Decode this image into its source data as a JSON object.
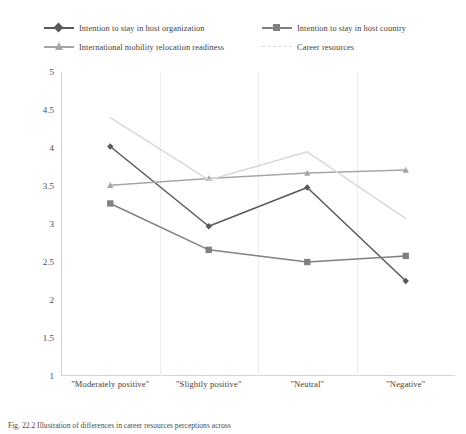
{
  "figure": {
    "caption": "Fig. 22.2  Illustration of differences in career resources perceptions across"
  },
  "legend": {
    "position": "top",
    "items": [
      {
        "label": "Intention to stay in host organization",
        "color": "#595959",
        "marker": "diamond",
        "style": "solid"
      },
      {
        "label": "Intention to stay in host country",
        "color": "#808080",
        "marker": "square",
        "style": "solid"
      },
      {
        "label": "International mobility relocation readiness",
        "color": "#a6a6a6",
        "marker": "triangle",
        "style": "solid"
      },
      {
        "label": "Career resources",
        "color": "#d9d9d9",
        "marker": "none",
        "style": "dashed"
      }
    ]
  },
  "axes": {
    "y_ticks": [
      "5",
      "4.5",
      "4",
      "3.5",
      "3",
      "2.5",
      "2",
      "1.5",
      "1"
    ],
    "x_categories": [
      "\"Moderately positive\"",
      "\"Slightly positive\"",
      "\"Neutral\"",
      "\"Negative\""
    ]
  },
  "chart_data": {
    "type": "line",
    "title": "",
    "xlabel": "",
    "ylabel": "",
    "ylim": [
      1,
      5
    ],
    "ytick_step": 0.5,
    "grid": "vertical",
    "legend_position": "top",
    "categories": [
      "\"Moderately positive\"",
      "\"Slightly positive\"",
      "\"Neutral\"",
      "\"Negative\""
    ],
    "series": [
      {
        "name": "Intention to stay in host organization",
        "color": "#595959",
        "marker": "diamond",
        "linestyle": "solid",
        "values": [
          4.02,
          2.97,
          3.48,
          2.25
        ]
      },
      {
        "name": "Intention to stay in host country",
        "color": "#808080",
        "marker": "square",
        "linestyle": "solid",
        "values": [
          3.27,
          2.66,
          2.5,
          2.58
        ]
      },
      {
        "name": "International mobility relocation readiness",
        "color": "#a6a6a6",
        "marker": "triangle",
        "linestyle": "solid",
        "values": [
          3.51,
          3.6,
          3.67,
          3.71
        ]
      },
      {
        "name": "Career resources",
        "color": "#d9d9d9",
        "marker": "none",
        "linestyle": "dashed",
        "values": [
          4.4,
          3.58,
          3.95,
          3.07
        ]
      }
    ]
  }
}
